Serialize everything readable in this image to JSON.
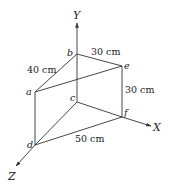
{
  "figure": {
    "type": "3d-geometry-wedge",
    "axes": {
      "x_label": "X",
      "y_label": "Y",
      "z_label": "Z"
    },
    "points": {
      "a": "a",
      "b": "b",
      "c": "c",
      "d": "d",
      "e": "e",
      "f": "f"
    },
    "dimensions": {
      "be": "30 cm",
      "ab": "40 cm",
      "ef": "30 cm",
      "df": "50 cm"
    },
    "colors": {
      "line": "#333333",
      "text": "#222222",
      "background": "#ffffff"
    }
  }
}
